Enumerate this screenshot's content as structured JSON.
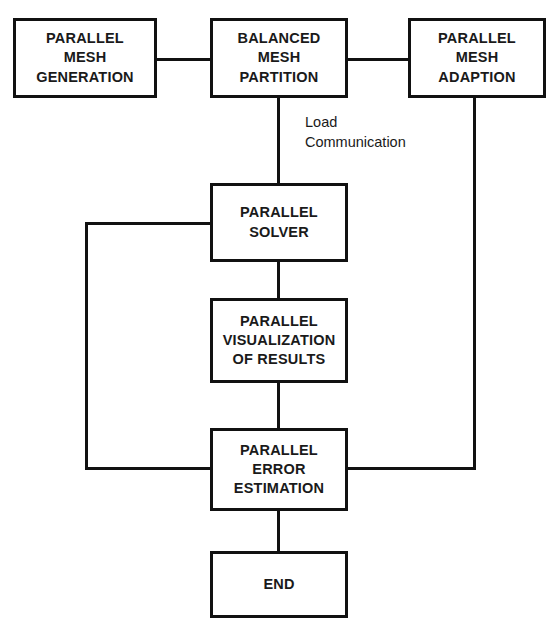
{
  "diagram": {
    "type": "flowchart",
    "line_color": "#111111",
    "text_color": "#1a1a1a",
    "background_color": "#ffffff",
    "nodes": [
      {
        "id": "parallel-mesh-generation",
        "lines": [
          "PARALLEL",
          "MESH",
          "GENERATION"
        ],
        "x": 13,
        "y": 18,
        "w": 144,
        "h": 80
      },
      {
        "id": "balanced-mesh-partition",
        "lines": [
          "BALANCED",
          "MESH",
          "PARTITION"
        ],
        "x": 210,
        "y": 18,
        "w": 138,
        "h": 80
      },
      {
        "id": "parallel-mesh-adaption",
        "lines": [
          "PARALLEL",
          "MESH",
          "ADAPTION"
        ],
        "x": 408,
        "y": 18,
        "w": 138,
        "h": 80
      },
      {
        "id": "parallel-solver",
        "lines": [
          "PARALLEL",
          "SOLVER"
        ],
        "x": 210,
        "y": 183,
        "w": 138,
        "h": 79
      },
      {
        "id": "parallel-visualization-of-results",
        "lines": [
          "PARALLEL",
          "VISUALIZATION",
          "OF RESULTS"
        ],
        "x": 210,
        "y": 298,
        "w": 138,
        "h": 85
      },
      {
        "id": "parallel-error-estimation",
        "lines": [
          "PARALLEL",
          "ERROR",
          "ESTIMATION"
        ],
        "x": 210,
        "y": 428,
        "w": 138,
        "h": 83
      },
      {
        "id": "end",
        "lines": [
          "END"
        ],
        "x": 210,
        "y": 551,
        "w": 138,
        "h": 67
      }
    ],
    "annotations": [
      {
        "id": "load-communication-label",
        "lines": [
          "Load",
          "Communication"
        ],
        "x": 305,
        "y": 112
      }
    ],
    "edges": [
      {
        "id": "generation-to-partition",
        "orient": "h",
        "x": 157,
        "y": 58,
        "len": 53
      },
      {
        "id": "partition-to-adaption",
        "orient": "h",
        "x": 348,
        "y": 58,
        "len": 60
      },
      {
        "id": "partition-down-to-solver",
        "orient": "v",
        "x": 277,
        "y": 98,
        "len": 85
      },
      {
        "id": "solver-down-to-visualization",
        "orient": "v",
        "x": 277,
        "y": 262,
        "len": 36
      },
      {
        "id": "visualization-down-to-error",
        "orient": "v",
        "x": 277,
        "y": 383,
        "len": 45
      },
      {
        "id": "error-down-to-end",
        "orient": "v",
        "x": 277,
        "y": 511,
        "len": 40
      },
      {
        "id": "error-feedback-left-stub",
        "orient": "h",
        "x": 85,
        "y": 467,
        "len": 125
      },
      {
        "id": "error-feedback-left-riser",
        "orient": "v",
        "x": 85,
        "y": 222,
        "len": 248
      },
      {
        "id": "error-feedback-left-into-solver",
        "orient": "h",
        "x": 85,
        "y": 222,
        "len": 125
      },
      {
        "id": "adaption-down-riser",
        "orient": "v",
        "x": 473,
        "y": 98,
        "len": 372
      },
      {
        "id": "error-feedback-right-stub",
        "orient": "h",
        "x": 348,
        "y": 467,
        "len": 128
      }
    ]
  }
}
